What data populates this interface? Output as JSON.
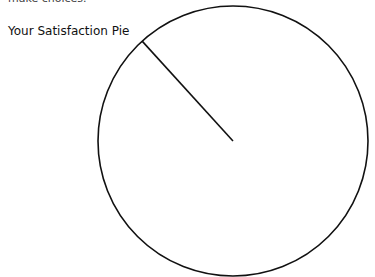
{
  "header": {
    "cropped_text": "make choices."
  },
  "chart_data": {
    "type": "pie",
    "title": "Your Satisfaction Pie",
    "categories": [
      "Slice"
    ],
    "values": [
      100
    ],
    "slice_divider_angle_deg": 227.7,
    "center": [
      233,
      141
    ],
    "radius": 135,
    "stroke_color": "#111111",
    "fill_color": "#ffffff",
    "legend": [],
    "annotations": []
  }
}
